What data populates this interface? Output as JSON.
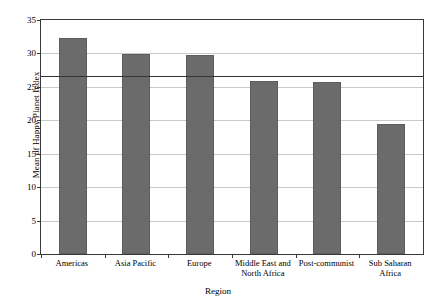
{
  "chart_data": {
    "type": "bar",
    "title": "",
    "xlabel": "Region",
    "ylabel": "Mean of Happy Planet Index",
    "categories": [
      "Americas",
      "Asia Pacific",
      "Europe",
      "Middle East and\nNorth Africa",
      "Post-communist",
      "Sub Saharan\nAfrica"
    ],
    "values": [
      32.3,
      29.9,
      29.8,
      25.9,
      25.8,
      19.4
    ],
    "ylim": [
      0,
      35
    ],
    "yticks": [
      0,
      5,
      10,
      15,
      20,
      25,
      30,
      35
    ],
    "ytick_labels": [
      "0",
      "5",
      "10",
      "15",
      "20",
      "25",
      "30",
      "35"
    ],
    "grid": true,
    "grid_axis": "y",
    "legend": "none",
    "reference_line": {
      "value": 26.6,
      "label": "",
      "color": "#333333"
    },
    "series_color": "#6b6b6b",
    "frame_color": "#3a3a3a",
    "grid_color": "#c9c9c9",
    "background": "#ffffff"
  }
}
